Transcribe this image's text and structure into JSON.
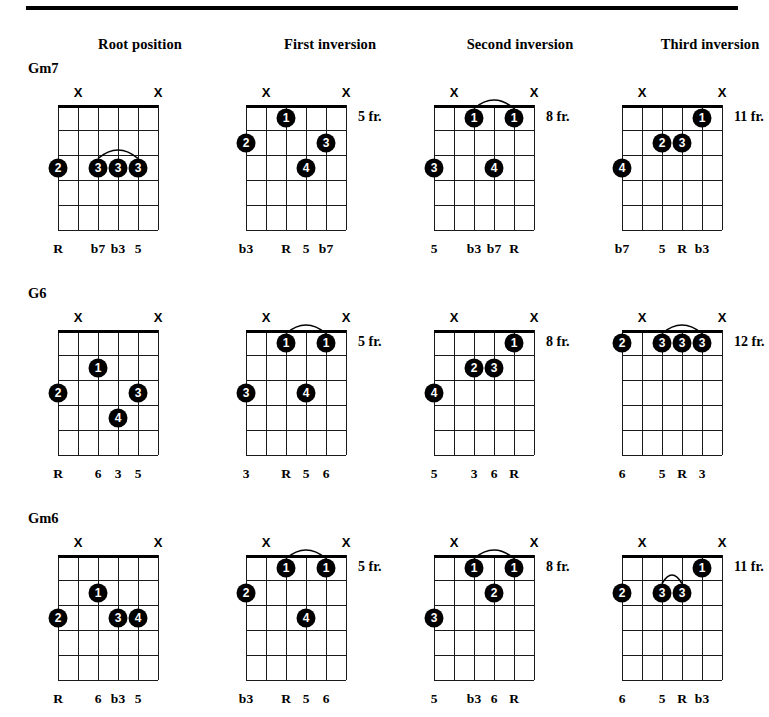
{
  "header": {
    "columns": [
      {
        "label": "Root position"
      },
      {
        "label": "First inversion"
      },
      {
        "label": "Second inversion"
      },
      {
        "label": "Third inversion"
      }
    ]
  },
  "grid": {
    "strings": 6,
    "frets": 5,
    "muted_marker": "X",
    "fret_suffix": "fr."
  },
  "rows": [
    {
      "chord": "Gm7",
      "diagrams": [
        {
          "fret_label": "",
          "muted_strings": [
            2,
            6
          ],
          "dots": [
            {
              "string": 1,
              "fret": 3,
              "finger": "2"
            },
            {
              "string": 3,
              "fret": 3,
              "finger": "3"
            },
            {
              "string": 4,
              "fret": 3,
              "finger": "3"
            },
            {
              "string": 5,
              "fret": 3,
              "finger": "3"
            }
          ],
          "barre": {
            "from_string": 3,
            "to_string": 5,
            "fret": 3
          },
          "intervals": [
            {
              "string": 1,
              "label": "R"
            },
            {
              "string": 3,
              "label": "b7"
            },
            {
              "string": 4,
              "label": "b3"
            },
            {
              "string": 5,
              "label": "5"
            }
          ]
        },
        {
          "fret_label": "5 fr.",
          "muted_strings": [
            2,
            6
          ],
          "dots": [
            {
              "string": 3,
              "fret": 1,
              "finger": "1"
            },
            {
              "string": 1,
              "fret": 2,
              "finger": "2"
            },
            {
              "string": 5,
              "fret": 2,
              "finger": "3"
            },
            {
              "string": 4,
              "fret": 3,
              "finger": "4"
            }
          ],
          "barre": null,
          "intervals": [
            {
              "string": 1,
              "label": "b3"
            },
            {
              "string": 3,
              "label": "R"
            },
            {
              "string": 4,
              "label": "5"
            },
            {
              "string": 5,
              "label": "b7"
            }
          ]
        },
        {
          "fret_label": "8 fr.",
          "muted_strings": [
            2,
            6
          ],
          "dots": [
            {
              "string": 3,
              "fret": 1,
              "finger": "1"
            },
            {
              "string": 5,
              "fret": 1,
              "finger": "1"
            },
            {
              "string": 1,
              "fret": 3,
              "finger": "3"
            },
            {
              "string": 4,
              "fret": 3,
              "finger": "4"
            }
          ],
          "barre": {
            "from_string": 3,
            "to_string": 5,
            "fret": 1
          },
          "intervals": [
            {
              "string": 1,
              "label": "5"
            },
            {
              "string": 3,
              "label": "b3"
            },
            {
              "string": 4,
              "label": "b7"
            },
            {
              "string": 5,
              "label": "R"
            }
          ]
        },
        {
          "fret_label": "11 fr.",
          "muted_strings": [
            2,
            6
          ],
          "dots": [
            {
              "string": 5,
              "fret": 1,
              "finger": "1"
            },
            {
              "string": 3,
              "fret": 2,
              "finger": "2"
            },
            {
              "string": 4,
              "fret": 2,
              "finger": "3"
            },
            {
              "string": 1,
              "fret": 3,
              "finger": "4"
            }
          ],
          "barre": null,
          "intervals": [
            {
              "string": 1,
              "label": "b7"
            },
            {
              "string": 3,
              "label": "5"
            },
            {
              "string": 4,
              "label": "R"
            },
            {
              "string": 5,
              "label": "b3"
            }
          ]
        }
      ]
    },
    {
      "chord": "G6",
      "diagrams": [
        {
          "fret_label": "",
          "muted_strings": [
            2,
            6
          ],
          "dots": [
            {
              "string": 3,
              "fret": 2,
              "finger": "1"
            },
            {
              "string": 1,
              "fret": 3,
              "finger": "2"
            },
            {
              "string": 5,
              "fret": 3,
              "finger": "3"
            },
            {
              "string": 4,
              "fret": 4,
              "finger": "4"
            }
          ],
          "barre": null,
          "intervals": [
            {
              "string": 1,
              "label": "R"
            },
            {
              "string": 3,
              "label": "6"
            },
            {
              "string": 4,
              "label": "3"
            },
            {
              "string": 5,
              "label": "5"
            }
          ]
        },
        {
          "fret_label": "5 fr.",
          "muted_strings": [
            2,
            6
          ],
          "dots": [
            {
              "string": 3,
              "fret": 1,
              "finger": "1"
            },
            {
              "string": 5,
              "fret": 1,
              "finger": "1"
            },
            {
              "string": 1,
              "fret": 3,
              "finger": "3"
            },
            {
              "string": 4,
              "fret": 3,
              "finger": "4"
            }
          ],
          "barre": {
            "from_string": 3,
            "to_string": 5,
            "fret": 1
          },
          "intervals": [
            {
              "string": 1,
              "label": "3"
            },
            {
              "string": 3,
              "label": "R"
            },
            {
              "string": 4,
              "label": "5"
            },
            {
              "string": 5,
              "label": "6"
            }
          ]
        },
        {
          "fret_label": "8 fr.",
          "muted_strings": [
            2,
            6
          ],
          "dots": [
            {
              "string": 5,
              "fret": 1,
              "finger": "1"
            },
            {
              "string": 3,
              "fret": 2,
              "finger": "2"
            },
            {
              "string": 4,
              "fret": 2,
              "finger": "3"
            },
            {
              "string": 1,
              "fret": 3,
              "finger": "4"
            }
          ],
          "barre": null,
          "intervals": [
            {
              "string": 1,
              "label": "5"
            },
            {
              "string": 3,
              "label": "3"
            },
            {
              "string": 4,
              "label": "6"
            },
            {
              "string": 5,
              "label": "R"
            }
          ]
        },
        {
          "fret_label": "12 fr.",
          "muted_strings": [
            2,
            6
          ],
          "dots": [
            {
              "string": 1,
              "fret": 1,
              "finger": "2"
            },
            {
              "string": 3,
              "fret": 1,
              "finger": "3"
            },
            {
              "string": 4,
              "fret": 1,
              "finger": "3"
            },
            {
              "string": 5,
              "fret": 1,
              "finger": "3"
            }
          ],
          "barre": {
            "from_string": 3,
            "to_string": 5,
            "fret": 1
          },
          "intervals": [
            {
              "string": 1,
              "label": "6"
            },
            {
              "string": 3,
              "label": "5"
            },
            {
              "string": 4,
              "label": "R"
            },
            {
              "string": 5,
              "label": "3"
            }
          ]
        }
      ]
    },
    {
      "chord": "Gm6",
      "diagrams": [
        {
          "fret_label": "",
          "muted_strings": [
            2,
            6
          ],
          "dots": [
            {
              "string": 3,
              "fret": 2,
              "finger": "1"
            },
            {
              "string": 1,
              "fret": 3,
              "finger": "2"
            },
            {
              "string": 4,
              "fret": 3,
              "finger": "3"
            },
            {
              "string": 5,
              "fret": 3,
              "finger": "4"
            }
          ],
          "barre": null,
          "intervals": [
            {
              "string": 1,
              "label": "R"
            },
            {
              "string": 3,
              "label": "6"
            },
            {
              "string": 4,
              "label": "b3"
            },
            {
              "string": 5,
              "label": "5"
            }
          ]
        },
        {
          "fret_label": "5 fr.",
          "muted_strings": [
            2,
            6
          ],
          "dots": [
            {
              "string": 3,
              "fret": 1,
              "finger": "1"
            },
            {
              "string": 5,
              "fret": 1,
              "finger": "1"
            },
            {
              "string": 1,
              "fret": 2,
              "finger": "2"
            },
            {
              "string": 4,
              "fret": 3,
              "finger": "4"
            }
          ],
          "barre": {
            "from_string": 3,
            "to_string": 5,
            "fret": 1
          },
          "intervals": [
            {
              "string": 1,
              "label": "b3"
            },
            {
              "string": 3,
              "label": "R"
            },
            {
              "string": 4,
              "label": "5"
            },
            {
              "string": 5,
              "label": "6"
            }
          ]
        },
        {
          "fret_label": "8 fr.",
          "muted_strings": [
            2,
            6
          ],
          "dots": [
            {
              "string": 3,
              "fret": 1,
              "finger": "1"
            },
            {
              "string": 5,
              "fret": 1,
              "finger": "1"
            },
            {
              "string": 4,
              "fret": 2,
              "finger": "2"
            },
            {
              "string": 1,
              "fret": 3,
              "finger": "3"
            }
          ],
          "barre": {
            "from_string": 3,
            "to_string": 5,
            "fret": 1
          },
          "intervals": [
            {
              "string": 1,
              "label": "5"
            },
            {
              "string": 3,
              "label": "b3"
            },
            {
              "string": 4,
              "label": "6"
            },
            {
              "string": 5,
              "label": "R"
            }
          ]
        },
        {
          "fret_label": "11 fr.",
          "muted_strings": [
            2,
            6
          ],
          "dots": [
            {
              "string": 5,
              "fret": 1,
              "finger": "1"
            },
            {
              "string": 1,
              "fret": 2,
              "finger": "2"
            },
            {
              "string": 3,
              "fret": 2,
              "finger": "3"
            },
            {
              "string": 4,
              "fret": 2,
              "finger": "3"
            }
          ],
          "barre": {
            "from_string": 3,
            "to_string": 4,
            "fret": 2
          },
          "intervals": [
            {
              "string": 1,
              "label": "6"
            },
            {
              "string": 3,
              "label": "5"
            },
            {
              "string": 4,
              "label": "R"
            },
            {
              "string": 5,
              "label": "b3"
            }
          ]
        }
      ]
    }
  ],
  "layout": {
    "column_x": [
      140,
      330,
      520,
      710
    ],
    "diagram_x": [
      40,
      228,
      416,
      604
    ],
    "row_y": [
      60,
      285,
      510
    ]
  }
}
